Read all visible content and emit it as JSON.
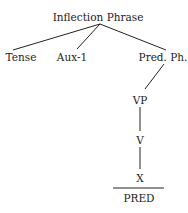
{
  "diagram": {
    "type": "syntax-tree",
    "nodes": {
      "root": {
        "label": "Inflection Phrase",
        "x": 98,
        "y": 11
      },
      "tense": {
        "label": "Tense",
        "x": 21,
        "y": 51
      },
      "aux": {
        "label": "Aux-1",
        "x": 72,
        "y": 51
      },
      "pred_ph": {
        "label": "Pred. Ph.",
        "x": 160,
        "y": 51
      },
      "vp": {
        "label": "VP",
        "x": 140,
        "y": 95
      },
      "v": {
        "label": "V",
        "x": 140,
        "y": 135
      },
      "x": {
        "label": "X",
        "x": 140,
        "y": 173
      },
      "pred": {
        "label": "PRED",
        "x": 141,
        "y": 193
      }
    },
    "edges": [
      {
        "from": "root",
        "to": "tense"
      },
      {
        "from": "root",
        "to": "aux"
      },
      {
        "from": "root",
        "to": "pred_ph"
      },
      {
        "from": "pred_ph",
        "to": "vp"
      },
      {
        "from": "vp",
        "to": "v"
      },
      {
        "from": "v",
        "to": "x"
      }
    ],
    "separator": {
      "between": [
        "x",
        "pred"
      ]
    },
    "colors": {
      "line": "#222222",
      "text": "#222222",
      "background": "#ffffff"
    }
  }
}
